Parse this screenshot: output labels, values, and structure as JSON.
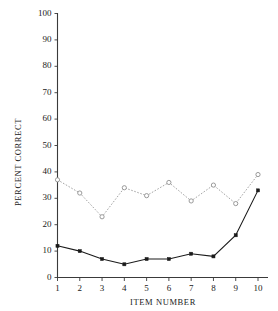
{
  "chart_data": {
    "type": "line",
    "title": "",
    "xlabel": "ITEM NUMBER",
    "ylabel": "PERCENT CORRECT",
    "categories": [
      1,
      2,
      3,
      4,
      5,
      6,
      7,
      8,
      9,
      10
    ],
    "x_tick_labels": [
      "1",
      "2",
      "3",
      "4",
      "5",
      "6",
      "7",
      "8",
      "9",
      "10"
    ],
    "y_tick_labels": [
      "0",
      "10",
      "20",
      "30",
      "40",
      "50",
      "60",
      "70",
      "80",
      "90",
      "100"
    ],
    "y_ticks": [
      0,
      10,
      20,
      30,
      40,
      50,
      60,
      70,
      80,
      90,
      100
    ],
    "ylim": [
      0,
      100
    ],
    "xlim": [
      1,
      10
    ],
    "grid": false,
    "legend": "none",
    "series": [
      {
        "name": "dotted-open-circle-series",
        "marker": "open-circle",
        "linestyle": "dotted",
        "color": "#9a9a9a",
        "values": [
          37,
          32,
          23,
          34,
          31,
          36,
          29,
          35,
          28,
          39
        ]
      },
      {
        "name": "solid-filled-square-series",
        "marker": "filled-square",
        "linestyle": "solid",
        "color": "#1a1a1a",
        "values": [
          12,
          10,
          7,
          5,
          7,
          7,
          9,
          8,
          16,
          33
        ]
      }
    ]
  },
  "axes": {
    "y_axis_title": "PERCENT CORRECT",
    "x_axis_title": "ITEM NUMBER"
  }
}
